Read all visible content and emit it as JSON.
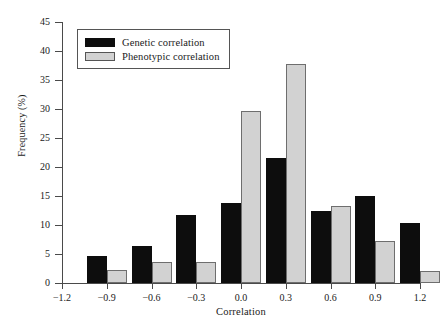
{
  "chart_data": {
    "type": "bar",
    "title": "",
    "xlabel": "Correlation",
    "ylabel": "Frequency (%)",
    "categories": [
      "-0.9",
      "-0.6",
      "-0.3",
      "0.0",
      "0.3",
      "0.6",
      "0.9",
      "1.2"
    ],
    "series": [
      {
        "name": "Genetic correlation",
        "color": "#0d0d0d",
        "values": [
          4.6,
          6.4,
          11.8,
          13.8,
          21.6,
          12.4,
          15.0,
          10.3
        ]
      },
      {
        "name": "Phenotypic correlation",
        "color": "#d2d2d2",
        "values": [
          2.2,
          3.6,
          3.6,
          29.7,
          37.8,
          13.3,
          7.2,
          2.0
        ]
      }
    ],
    "xlim": [
      -1.2,
      1.2
    ],
    "ylim": [
      0,
      45
    ],
    "xticks": [
      "-1.2",
      "-0.9",
      "-0.6",
      "-0.3",
      "0.0",
      "0.3",
      "0.6",
      "0.9",
      "1.2"
    ],
    "yticks": [
      "0",
      "5",
      "10",
      "15",
      "20",
      "25",
      "30",
      "35",
      "40",
      "45"
    ],
    "grid": false,
    "legend_position": "top-left"
  },
  "legend": {
    "items": [
      {
        "label": "Genetic correlation",
        "swatch": "genetic"
      },
      {
        "label": "Phenotypic correlation",
        "swatch": "pheno"
      }
    ]
  }
}
